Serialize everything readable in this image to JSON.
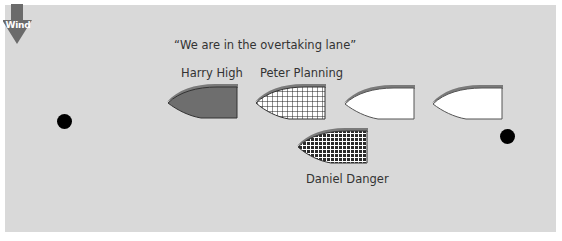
{
  "diagram": {
    "wind": {
      "label": "Wind",
      "icon": "arrow-down-icon",
      "color": "#6b6b6b"
    },
    "quote": "“We are in the overtaking lane”",
    "boats": [
      {
        "name": "Harry High",
        "fill": "solid",
        "color": "#6e6e6e"
      },
      {
        "name": "Peter Planning",
        "fill": "grid",
        "color": "#ffffff"
      },
      {
        "name": "",
        "fill": "white",
        "color": "#ffffff"
      },
      {
        "name": "",
        "fill": "white",
        "color": "#ffffff"
      },
      {
        "name": "Daniel Danger",
        "fill": "checker",
        "color": "#ffffff"
      }
    ],
    "marks": [
      {
        "name": "left-mark"
      },
      {
        "name": "right-mark"
      }
    ],
    "colors": {
      "background": "#d9d9d9",
      "shadow": "#7a7a7a",
      "outline": "#333333",
      "mark": "#000000"
    }
  }
}
